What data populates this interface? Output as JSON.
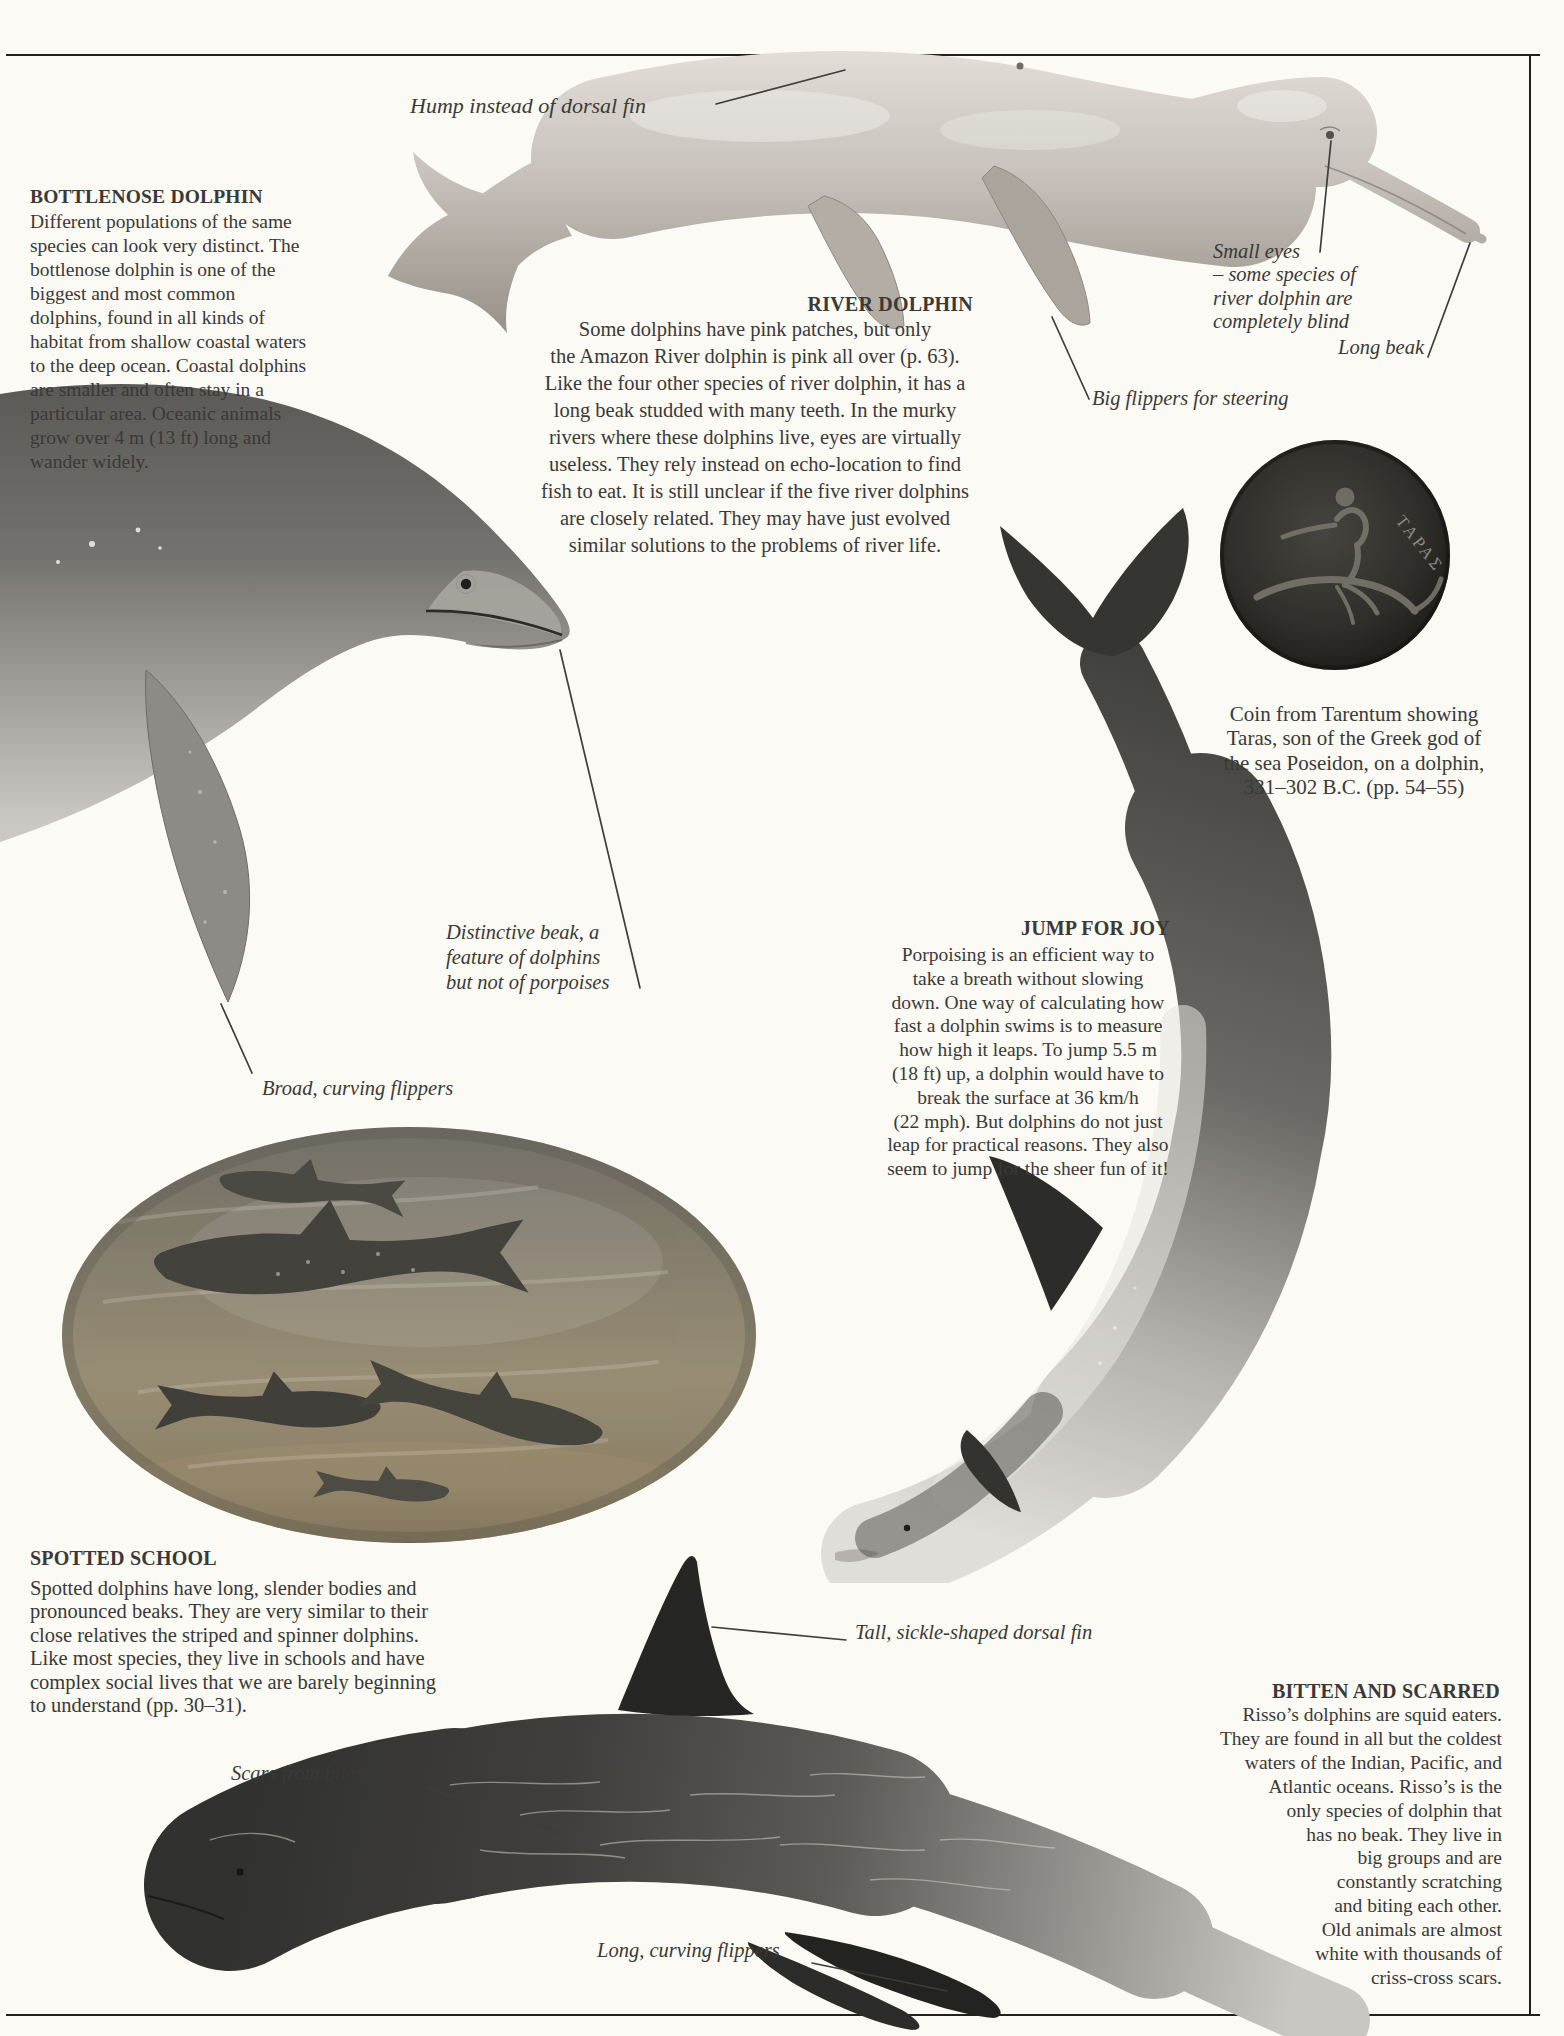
{
  "page": {
    "paper": "#fbfaf5",
    "ink": "#3a3938"
  },
  "sections": {
    "bottlenose": {
      "heading": "BOTTLENOSE DOLPHIN",
      "body": "Different populations of the same\nspecies can look very distinct. The\nbottlenose dolphin is one of the\nbiggest and most common\ndolphins, found in all kinds of\nhabitat from shallow coastal waters\nto the deep ocean. Coastal dolphins\nare smaller and often stay in a\nparticular area. Oceanic animals\ngrow over 4 m (13 ft) long and\nwander widely."
    },
    "river": {
      "heading": "RIVER DOLPHIN",
      "body": "Some dolphins have pink patches, but only\nthe Amazon River dolphin is pink all over (p. 63).\nLike the four other species of river dolphin, it has a\nlong beak studded with many teeth. In the murky\nrivers where these dolphins live, eyes are virtually\nuseless. They rely instead on echo-location to find\nfish to eat. It is still unclear if the five river dolphins\nare closely related. They may have just evolved\nsimilar solutions to the problems of river life."
    },
    "jump": {
      "heading": "JUMP FOR JOY",
      "body": "Porpoising is an efficient way to\ntake a breath without slowing\ndown. One way of calculating how\nfast a dolphin swims is to measure\nhow high it leaps. To jump 5.5 m\n(18 ft) up, a dolphin would have to\nbreak the surface at 36 km/h\n(22 mph). But dolphins do not just\nleap for practical reasons. They also\nseem to jump for the sheer fun of it!"
    },
    "spotted": {
      "heading": "SPOTTED SCHOOL",
      "body": "Spotted dolphins have long, slender bodies and\npronounced beaks. They are very similar to their\nclose relatives the striped and spinner dolphins.\nLike most species, they live in schools and have\ncomplex social lives that we are barely beginning\nto understand (pp. 30–31)."
    },
    "bitten": {
      "heading": "BITTEN AND SCARRED",
      "body": "Risso’s dolphins are squid eaters.\nThey are found in all but the coldest\nwaters of the Indian, Pacific, and\nAtlantic oceans. Risso’s is the\nonly species of dolphin that\nhas no beak. They live in\nbig groups and are\nconstantly scratching\nand biting each other.\nOld animals are almost\nwhite with thousands of\ncriss-cross scars."
    }
  },
  "captions": {
    "coin": "Coin from Tarentum showing\nTaras, son of the Greek god of\nthe sea Poseidon, on a dolphin,\n331–302 B.C. (pp. 54–55)"
  },
  "coin": {
    "inscription": "ΤΑΡΑΣ"
  },
  "annotations": {
    "hump": "Hump instead of dorsal fin",
    "small_eyes": "Small eyes\n– some species of\nriver dolphin are\ncompletely blind",
    "long_beak": "Long beak",
    "big_flippers": "Big flippers for steering",
    "distinctive_beak": "Distinctive beak, a\nfeature of dolphins\nbut not of porpoises",
    "broad_flippers": "Broad, curving flippers",
    "dorsal_fin": "Tall, sickle-shaped dorsal fin",
    "scars": "Scars from bites",
    "long_flippers": "Long, curving flippers"
  }
}
